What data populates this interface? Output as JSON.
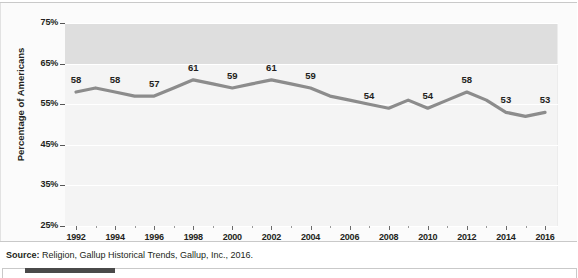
{
  "chart_data": {
    "type": "line",
    "title": "",
    "xlabel": "",
    "ylabel": "Percentage of Americans",
    "ylim": [
      25,
      75
    ],
    "xlim": [
      1992,
      2016
    ],
    "grid": true,
    "legend": false,
    "legend_position": "none",
    "yticks": [
      "75%",
      "65%",
      "55%",
      "45%",
      "35%",
      "25%"
    ],
    "ytick_values": [
      75,
      65,
      55,
      45,
      35,
      25
    ],
    "xticks": [
      "1992",
      "1994",
      "1996",
      "1998",
      "2000",
      "2002",
      "2004",
      "2006",
      "2008",
      "2010",
      "2012",
      "2014",
      "2016"
    ],
    "xtick_values": [
      1992,
      1994,
      1996,
      1998,
      2000,
      2002,
      2004,
      2006,
      2008,
      2010,
      2012,
      2014,
      2016
    ],
    "x": [
      1992,
      1993,
      1994,
      1995,
      1996,
      1997,
      1998,
      1999,
      2000,
      2001,
      2002,
      2003,
      2004,
      2005,
      2006,
      2007,
      2008,
      2009,
      2010,
      2011,
      2012,
      2013,
      2014,
      2015,
      2016
    ],
    "values": [
      58,
      59,
      58,
      57,
      57,
      59,
      61,
      60,
      59,
      60,
      61,
      60,
      59,
      57,
      56,
      55,
      54,
      56,
      54,
      56,
      58,
      56,
      53,
      52,
      53
    ],
    "series": [
      {
        "name": "Percentage of Americans",
        "color": "#8c8c8c",
        "values": [
          58,
          59,
          58,
          57,
          57,
          59,
          61,
          60,
          59,
          60,
          61,
          60,
          59,
          57,
          56,
          55,
          54,
          56,
          54,
          56,
          58,
          56,
          53,
          52,
          53
        ]
      }
    ],
    "point_labels": [
      {
        "x": 1992,
        "value": 58,
        "text": "58"
      },
      {
        "x": 1994,
        "value": 58,
        "text": "58"
      },
      {
        "x": 1996,
        "value": 57,
        "text": "57"
      },
      {
        "x": 1998,
        "value": 61,
        "text": "61"
      },
      {
        "x": 2000,
        "value": 59,
        "text": "59"
      },
      {
        "x": 2002,
        "value": 61,
        "text": "61"
      },
      {
        "x": 2004,
        "value": 59,
        "text": "59"
      },
      {
        "x": 2007,
        "value": 54,
        "text": "54"
      },
      {
        "x": 2010,
        "value": 54,
        "text": "54"
      },
      {
        "x": 2012,
        "value": 58,
        "text": "58"
      },
      {
        "x": 2014,
        "value": 53,
        "text": "53"
      },
      {
        "x": 2016,
        "value": 53,
        "text": "53"
      }
    ],
    "colors": {
      "line": "#8c8c8c",
      "plot_background": "#f4f4f4",
      "band_background": "#dedede",
      "gridline": "#ffffff",
      "text": "#231f20"
    }
  },
  "source": {
    "prefix": "Source:",
    "text": " Religion, Gallup Historical Trends, Gallup, Inc., 2016."
  }
}
